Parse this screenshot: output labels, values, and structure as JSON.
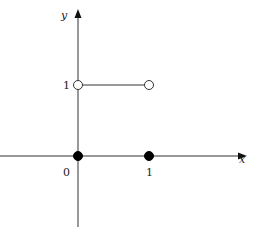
{
  "chart_data": {
    "type": "line",
    "title": "",
    "xlabel": "x",
    "ylabel": "y",
    "x_ticks": [
      {
        "value": 0,
        "label": "0"
      },
      {
        "value": 1,
        "label": "1"
      }
    ],
    "y_ticks": [
      {
        "value": 1,
        "label": "1"
      }
    ],
    "xlim": [
      -1.1,
      2.3
    ],
    "ylim": [
      -1.25,
      2.25
    ],
    "segments": [
      {
        "from": [
          0,
          1
        ],
        "to": [
          1,
          1
        ]
      }
    ],
    "points": [
      {
        "x": 0,
        "y": 1,
        "style": "open"
      },
      {
        "x": 1,
        "y": 1,
        "style": "open"
      },
      {
        "x": 0,
        "y": 0,
        "style": "filled"
      },
      {
        "x": 1,
        "y": 0,
        "style": "filled"
      }
    ],
    "grid": false,
    "legend": "none"
  }
}
